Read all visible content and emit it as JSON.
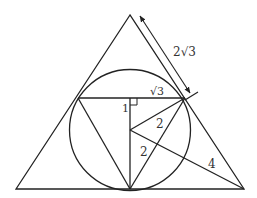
{
  "diagram": {
    "type": "geometry",
    "colors": {
      "stroke": "#222222",
      "text": "#333333",
      "background": "#ffffff"
    },
    "labels": {
      "side_segment": "2√3",
      "half_chord": "√3",
      "center_to_chord": "1",
      "radius_upper": "2",
      "radius_lower": "2",
      "center_to_vertex": "4"
    },
    "points": {
      "apex": [
        130,
        15
      ],
      "left_vertex": [
        16,
        189
      ],
      "right_vertex": [
        244,
        189
      ],
      "center": [
        130,
        130
      ],
      "bottom_tangent": [
        130,
        189
      ],
      "chord_left": [
        78,
        98
      ],
      "chord_right": [
        185,
        98
      ],
      "chord_mid": [
        130,
        98
      ]
    },
    "circle": {
      "cx": 130,
      "cy": 130,
      "r": 60.5
    }
  }
}
